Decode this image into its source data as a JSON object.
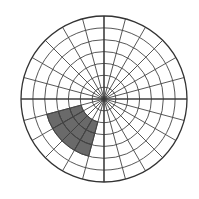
{
  "figure": {
    "background_color": "#ffffff",
    "width": 199,
    "height": 199
  },
  "chart_data": {
    "type": "pie",
    "subtype": "polar-grid-sector",
    "title": "",
    "subtitle": "",
    "xlabel": "",
    "ylabel": "",
    "grid": true,
    "legend": false,
    "legend_position": "none",
    "center": {
      "x": 104,
      "y": 99
    },
    "radius": 83,
    "angular_divisions": 24,
    "angular_step_degrees": 15,
    "radial_divisions": 7,
    "radial_ring_radii": [
      11.9,
      23.7,
      35.6,
      47.4,
      59.3,
      71.1,
      83.0
    ],
    "tick_labels_radial": [
      "",
      "",
      "",
      "",
      "",
      "",
      ""
    ],
    "tick_labels_angular": [
      "",
      "",
      "",
      "",
      "",
      "",
      "",
      "",
      "",
      "",
      "",
      "",
      "",
      "",
      "",
      "",
      "",
      "",
      "",
      "",
      "",
      "",
      "",
      ""
    ],
    "grid_color": "#444444",
    "grid_line_width": 0.9,
    "outline_color": "#333333",
    "outline_line_width": 1.3,
    "axis_color": "#333333",
    "sectors": [
      {
        "name": "shaded-sector",
        "fill_color": "#6a6a6a",
        "edge_color": "#3a3a3a",
        "start_angle_degrees": 195,
        "end_angle_degrees": 255,
        "inner_ring_index": 2,
        "outer_ring_index": 5,
        "inner_radius": 23.7,
        "outer_radius": 59.3,
        "angular_cells": 4,
        "radial_cells": 3
      }
    ],
    "axes_lines": [
      {
        "name": "horizontal-axis",
        "angle_degrees": 0
      },
      {
        "name": "vertical-axis",
        "angle_degrees": 90
      }
    ],
    "values": [
      1
    ],
    "categories": [
      "shaded-sector"
    ]
  }
}
